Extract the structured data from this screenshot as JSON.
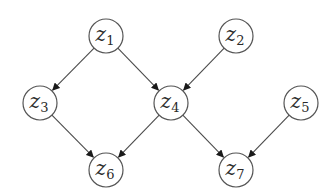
{
  "diagram": {
    "type": "directed-acyclic-graph",
    "node_radius": 17,
    "colors": {
      "stroke": "#555555",
      "edge": "#4a4a4a",
      "arrowhead": "#1a1a1a",
      "text": "#2a2a2a",
      "background": "#ffffff"
    },
    "nodes": [
      {
        "id": "z1",
        "base": "z",
        "sub": "1",
        "x": 106,
        "y": 36
      },
      {
        "id": "z2",
        "base": "z",
        "sub": "2",
        "x": 236,
        "y": 36
      },
      {
        "id": "z3",
        "base": "z",
        "sub": "3",
        "x": 40,
        "y": 103
      },
      {
        "id": "z4",
        "base": "z",
        "sub": "4",
        "x": 171,
        "y": 103
      },
      {
        "id": "z5",
        "base": "z",
        "sub": "5",
        "x": 301,
        "y": 103
      },
      {
        "id": "z6",
        "base": "z",
        "sub": "6",
        "x": 106,
        "y": 170
      },
      {
        "id": "z7",
        "base": "z",
        "sub": "7",
        "x": 236,
        "y": 170
      }
    ],
    "edges": [
      {
        "from": "z1",
        "to": "z3"
      },
      {
        "from": "z1",
        "to": "z4"
      },
      {
        "from": "z2",
        "to": "z4"
      },
      {
        "from": "z3",
        "to": "z6"
      },
      {
        "from": "z4",
        "to": "z6"
      },
      {
        "from": "z4",
        "to": "z7"
      },
      {
        "from": "z5",
        "to": "z7"
      }
    ]
  }
}
